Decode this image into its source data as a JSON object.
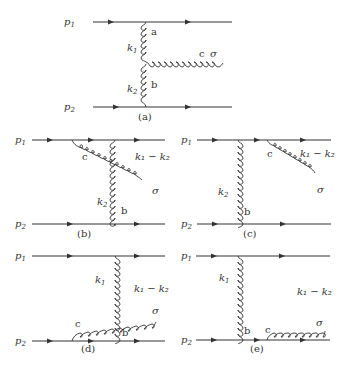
{
  "figure": {
    "panels": [
      {
        "id": "a",
        "caption": "(a)",
        "incoming": [
          {
            "label": "p",
            "sub": "1"
          },
          {
            "label": "p",
            "sub": "2"
          }
        ],
        "gluon_labels": {
          "k1": "k",
          "k1_sub": "1",
          "k2": "k",
          "k2_sub": "2",
          "a": "a",
          "b": "b",
          "c": "c",
          "sigma": "σ"
        }
      },
      {
        "id": "b",
        "caption": "(b)",
        "incoming": [
          {
            "label": "p",
            "sub": "1"
          },
          {
            "label": "p",
            "sub": "2"
          }
        ],
        "gluon_labels": {
          "c": "c",
          "k2": "k",
          "k2_sub": "2",
          "b": "b",
          "sigma": "σ",
          "emitted": "k₁ − k₂"
        }
      },
      {
        "id": "c",
        "caption": "(c)",
        "incoming": [
          {
            "label": "p",
            "sub": "1"
          },
          {
            "label": "p",
            "sub": "2"
          }
        ],
        "gluon_labels": {
          "c": "c",
          "k2": "k",
          "k2_sub": "2",
          "b": "b",
          "sigma": "σ",
          "emitted": "k₁ − k₂"
        }
      },
      {
        "id": "d",
        "caption": "(d)",
        "incoming": [
          {
            "label": "p",
            "sub": "1"
          },
          {
            "label": "p",
            "sub": "2"
          }
        ],
        "gluon_labels": {
          "c": "c",
          "k1": "k",
          "k1_sub": "1",
          "b": "b",
          "sigma": "σ",
          "emitted": "k₁ − k₂"
        }
      },
      {
        "id": "e",
        "caption": "(e)",
        "incoming": [
          {
            "label": "p",
            "sub": "1"
          },
          {
            "label": "p",
            "sub": "2"
          }
        ],
        "gluon_labels": {
          "c": "c",
          "k1": "k",
          "k1_sub": "1",
          "b": "b",
          "sigma": "σ",
          "emitted": "k₁ − k₂"
        }
      }
    ]
  }
}
